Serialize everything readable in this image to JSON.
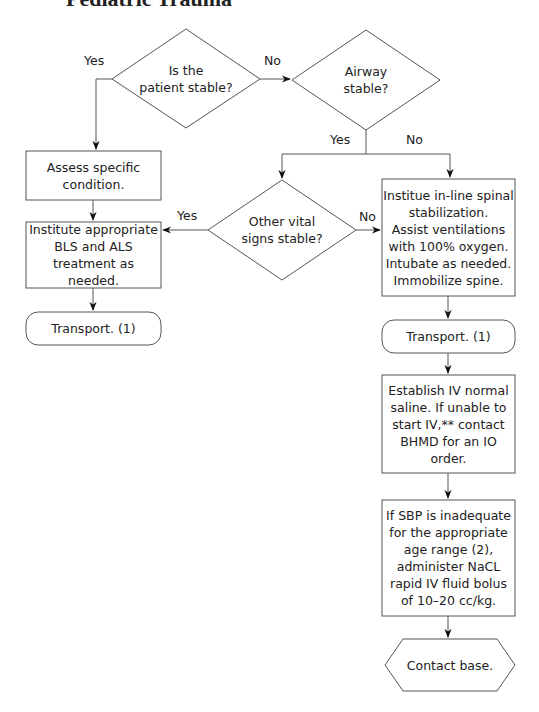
{
  "title": "Pediatric Trauma",
  "colors": {
    "line": "#555555",
    "text": "#222222",
    "background": "#ffffff"
  },
  "nodes": {
    "patient_stable": {
      "shape": "diamond",
      "text": "Is the\npatient stable?"
    },
    "airway_stable": {
      "shape": "diamond",
      "text": "Airway\nstable?"
    },
    "assess_condition": {
      "shape": "rect",
      "text": "Assess specific\ncondition."
    },
    "other_vitals": {
      "shape": "diamond",
      "text": "Other vital\nsigns stable?"
    },
    "institute_bls_als": {
      "shape": "rect",
      "text": "Institute appropriate\nBLS and ALS\ntreatment as needed."
    },
    "transport_left": {
      "shape": "rounded",
      "text": "Transport. (1)"
    },
    "spinal_stabilization": {
      "shape": "rect",
      "text": "Institue in-line spinal\nstabilization.\nAssist ventilations\nwith 100% oxygen.\nIntubate as needed.\nImmobilize spine."
    },
    "transport_right": {
      "shape": "rounded",
      "text": "Transport. (1)"
    },
    "establish_iv": {
      "shape": "rect",
      "text": "Establish IV normal\nsaline. If unable to\nstart IV,** contact\nBHMD for an IO\norder."
    },
    "sbp_bolus": {
      "shape": "rect",
      "text": "If SBP is inadequate\nfor the appropriate\nage range (2),\nadminister NaCL\nrapid IV fluid bolus\nof 10–20 cc/kg."
    },
    "contact_base": {
      "shape": "hexagon",
      "text": "Contact base."
    }
  },
  "edge_labels": {
    "patient_yes": "Yes",
    "patient_no": "No",
    "airway_yes": "Yes",
    "airway_no": "No",
    "vitals_yes": "Yes",
    "vitals_no": "No"
  }
}
